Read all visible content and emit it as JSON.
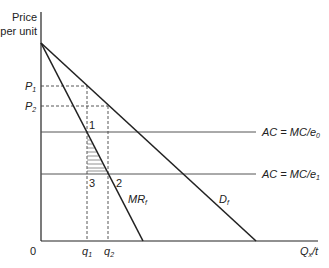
{
  "diagram": {
    "y_axis_label_line1": "Price",
    "y_axis_label_line2": "per unit",
    "x_axis_label": "Q",
    "x_axis_label_sub": "x",
    "x_axis_label_suffix": "/t",
    "origin_label": "0",
    "price_labels": [
      {
        "base": "P",
        "sub": "1"
      },
      {
        "base": "P",
        "sub": "2"
      }
    ],
    "quantity_labels": [
      {
        "base": "q",
        "sub": "1"
      },
      {
        "base": "q",
        "sub": "2"
      }
    ],
    "points": [
      "1",
      "2",
      "3"
    ],
    "curves": {
      "mr": {
        "base": "MR",
        "sub": "f"
      },
      "demand": {
        "base": "D",
        "sub": "f"
      },
      "ac0": {
        "text": "AC = MC/e",
        "sub": "0"
      },
      "ac1": {
        "text": "AC = MC/e",
        "sub": "1"
      }
    },
    "colors": {
      "line": "#222222",
      "dashed": "#444444",
      "ac_line": "#555555",
      "hatch": "#777777"
    }
  }
}
